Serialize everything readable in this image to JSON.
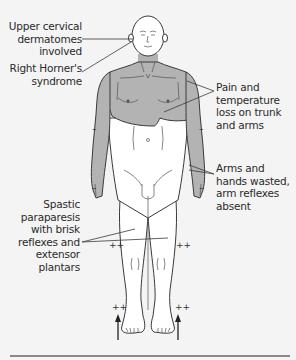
{
  "figure": {
    "colors": {
      "background": "#f4f4f4",
      "skin": "#ffffff",
      "affected_shading": "#b3b3b3",
      "outline": "#3a3a3a",
      "rule": "#8a8a8a"
    },
    "labels": {
      "upper_cervical": [
        "Upper cervical",
        "dermatomes",
        "involved"
      ],
      "horner": [
        "Right Horner's",
        "syndrome"
      ],
      "pain_temp": [
        "Pain and",
        "temperature",
        "loss on trunk",
        "and arms"
      ],
      "arms_wasted": [
        "Arms and",
        "hands wasted,",
        "arm reflexes",
        "absent"
      ],
      "spastic": [
        "Spastic",
        "paraparesis",
        "with brisk",
        "reflexes and",
        "extensor",
        "plantars"
      ]
    },
    "reflex_markers": {
      "arm_upper_left": "–",
      "arm_upper_right": "–",
      "arm_lower_left": "–",
      "arm_lower_right": "–",
      "knee_left": "++",
      "knee_right": "++",
      "ankle_left": "++",
      "ankle_right": "++"
    },
    "plantar_indicator": "up-arrow"
  }
}
